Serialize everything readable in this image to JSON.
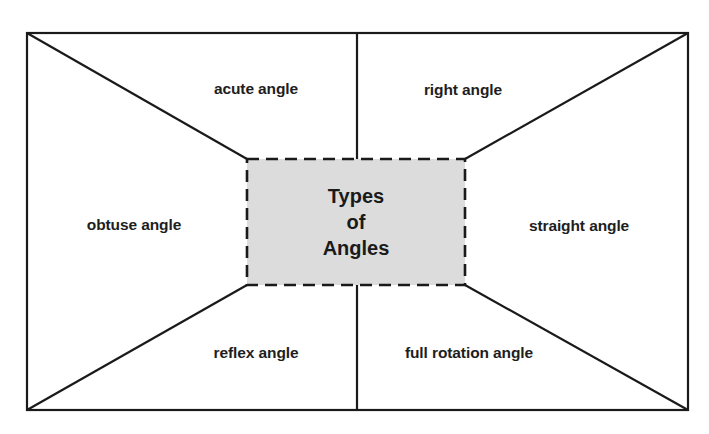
{
  "diagram": {
    "center": {
      "lines": [
        "Types",
        "of",
        "Angles"
      ],
      "fill": "#dcdcdc",
      "border": "dashed"
    },
    "regions": {
      "top_left": "acute angle",
      "top_right": "right angle",
      "left": "obtuse angle",
      "right": "straight angle",
      "bottom_left": "reflex angle",
      "bottom_right": "full rotation angle"
    },
    "colors": {
      "line": "#1a1a1a",
      "center_fill": "#dcdcdc",
      "background": "#ffffff"
    }
  }
}
